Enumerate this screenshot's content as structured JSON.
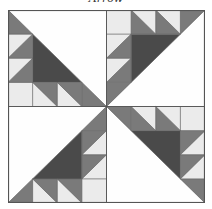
{
  "title": "Arrow",
  "caption": "",
  "block": {
    "name": "Arrow quilt block",
    "grid": "8x8",
    "quadrants": 4,
    "symmetry": "4-fold rotational",
    "colors": {
      "white": "#fefefe",
      "light": "#ebebeb",
      "medium": "#7a7a7a",
      "dark": "#4a4a4a",
      "border": "#555555"
    }
  }
}
